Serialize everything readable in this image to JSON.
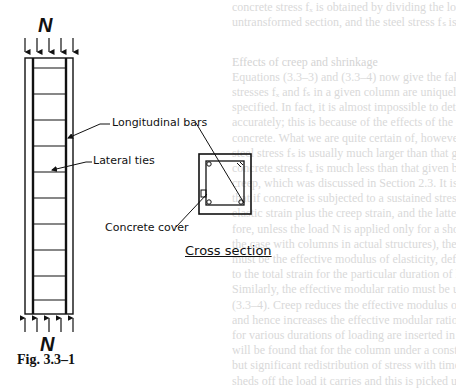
{
  "figure": {
    "load_label_top": "N",
    "load_label_bottom": "N",
    "labels": {
      "longitudinal_bars": "Longitudinal bars",
      "lateral_ties": "Lateral ties",
      "concrete_cover": "Concrete cover",
      "cross_section": "Cross section"
    },
    "caption": "Fig. 3.3–1"
  },
  "bleed_through_text": {
    "lines": [
      "concrete stress fₓ is obtained by dividing the load N by the area of the",
      "untransformed section, and the steel stress fₛ is αₑ times fₓ.",
      "",
      "",
      "Effects of creep and shrinkage",
      "Equations (3.3–3) and (3.3–4) now give the false impression that the",
      "stresses fₓ and fₛ in a given column are uniquely defined once the load N is",
      "specified. In fact, it is almost impossible to determine these stresses",
      "accurately; this is because of the effects of the creep and shrinkage of the",
      "concrete. What we are quite certain of, however, is that in practice the",
      "steel stress fₛ is usually much larger than that given by eqn (3.3–4) and the",
      "concrete stress fₓ is much less than that given by eqn (3.3–3). Consider",
      "creep, which was discussed in Section 2.3. It is clear from Fig. 2.3–1",
      "that if concrete is subjected to a sustained stress, the total strain is the",
      "elastic strain plus the creep strain, and the latter increases with time. There-",
      "fore, unless the load N is applied only for a short time (and this is rarely",
      "the case with columns in actual structures), the Eₓ to be used in eqn (3.3–3)",
      "must be the effective modulus of elasticity, defined as the ratio of the stress",
      "to the total strain for the particular duration of loading concerned.",
      "Similarly, the effective modular ratio must be used in eqns (3.3–3) and",
      "(3.3–4). Creep reduces the effective modulus of elasticity of the concrete",
      "and hence increases the effective modular ratio. If the effective values of αₑ",
      "for various durations of loading are inserted in eqns (3.3–3) and (3.3–4), it",
      "will be found that for the column under a constant load, there is a gradual",
      "but significant redistribution of stress with time: the concrete gradually",
      "sheds off the load it carries and this is picked up by the steel. The",
      "redistribution may continue for years until the effective modulus ratio"
    ]
  }
}
